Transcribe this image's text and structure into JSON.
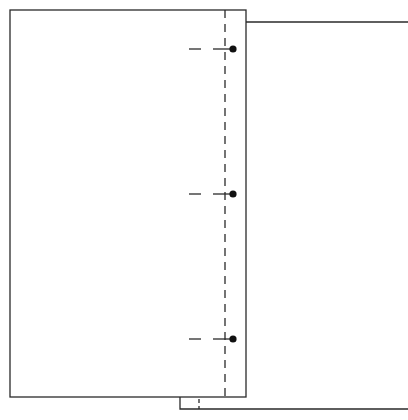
{
  "diagram": {
    "type": "technical-line-drawing",
    "colors": {
      "stroke": "#2a2a2a",
      "background": "#ffffff"
    },
    "front_panel": {
      "x": 10,
      "y": 10,
      "width": 236,
      "height": 387
    },
    "back_panel": {
      "left": 246,
      "top": 22,
      "bottom": 409,
      "bottom_left": 180,
      "right_extends_past": 408
    },
    "bottom_step": {
      "x": 180,
      "y1": 397,
      "y2": 409
    },
    "hinge_line": {
      "x": 225,
      "y1": 10,
      "y2": 397,
      "style": "dashed"
    },
    "hinge_line_lower": {
      "x": 199,
      "y1": 397,
      "y2": 409,
      "style": "dashed"
    },
    "markers": [
      {
        "name": "marker-top",
        "y": 49,
        "dot_x": 233
      },
      {
        "name": "marker-middle",
        "y": 194,
        "dot_x": 233
      },
      {
        "name": "marker-bottom",
        "y": 339,
        "dot_x": 233
      }
    ]
  }
}
